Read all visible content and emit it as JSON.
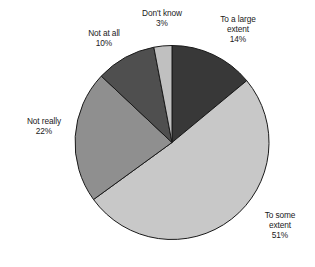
{
  "chart_data": {
    "type": "pie",
    "title": "",
    "subtitle": "",
    "xlabel": "",
    "ylabel": "",
    "legend_position": "none",
    "grid": false,
    "unit": "%",
    "start_angle_deg": 0,
    "direction": "clockwise",
    "categories": [
      "To a large extent",
      "To some extent",
      "Not really",
      "Not at all",
      "Don't know"
    ],
    "values": [
      14,
      51,
      22,
      10,
      3
    ],
    "slices": [
      {
        "label": "To a large extent",
        "label_text": "To a large\nextent\n14%",
        "value": 14,
        "value_text": "14%",
        "color": "#383838",
        "start_deg": 0,
        "end_deg": 50.4
      },
      {
        "label": "To some extent",
        "label_text": "To some\nextent\n51%",
        "value": 51,
        "value_text": "51%",
        "color": "#c8c8c8",
        "start_deg": 50.4,
        "end_deg": 234.0
      },
      {
        "label": "Not really",
        "label_text": "Not really\n22%",
        "value": 22,
        "value_text": "22%",
        "color": "#8f8f8f",
        "start_deg": 234.0,
        "end_deg": 313.2
      },
      {
        "label": "Not at all",
        "label_text": "Not at all\n10%",
        "value": 10,
        "value_text": "10%",
        "color": "#4f4f4f",
        "start_deg": 313.2,
        "end_deg": 349.2
      },
      {
        "label": "Don't know",
        "label_text": "Don't know\n3%",
        "value": 3,
        "value_text": "3%",
        "color": "#c0c0c0",
        "start_deg": 349.2,
        "end_deg": 360.0
      }
    ],
    "geometry": {
      "center_x": 172,
      "center_y": 142.5,
      "radius": 97
    },
    "stroke_color": "#1a1a1a",
    "background": "#ffffff"
  }
}
